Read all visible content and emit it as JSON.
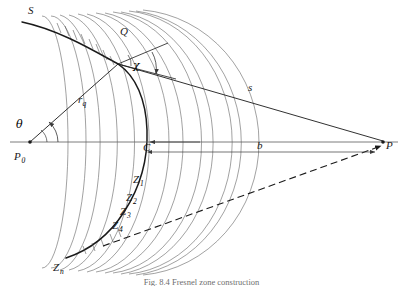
{
  "figure": {
    "title_label": "S",
    "caption": "Fig. 8.4 Fresnel zone construction",
    "labels": {
      "wavefront": "S",
      "point_q": "Q",
      "angle_chi": "χ",
      "angle_theta": "θ",
      "source": "P",
      "source_sub": "0",
      "center": "C",
      "field_point": "P",
      "radius_r": "r",
      "radius_r_sub": "q",
      "distance_s": "s",
      "distance_b": "b",
      "zone_1": "Z",
      "zone_1_sub": "1",
      "zone_2": "Z",
      "zone_2_sub": "2",
      "zone_3": "Z",
      "zone_3_sub": "3",
      "zone_4": "Z",
      "zone_4_sub": "4",
      "zone_n": "Z",
      "zone_n_sub": "n"
    },
    "colors": {
      "ink": "#1a1a1a",
      "thin_ink": "#4a4a4a",
      "axis": "#5a5a5a",
      "background": "#ffffff"
    },
    "geometry": {
      "source_point": [
        30,
        142
      ],
      "center_point": [
        140,
        142
      ],
      "field_point": [
        383,
        142
      ],
      "q_point": [
        118,
        64
      ],
      "zone_arc_count": 13
    }
  }
}
